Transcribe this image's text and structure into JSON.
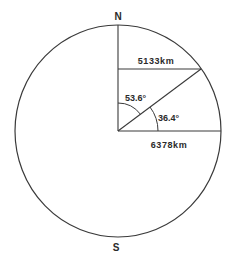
{
  "diagram": {
    "pole_labels": {
      "north": "N",
      "south": "S"
    },
    "distances": {
      "horizontal_chord": "5133km",
      "radius": "6378km"
    },
    "angles": {
      "colatitude": "53.6°",
      "latitude": "36.4°"
    },
    "colors": {
      "line": "#3a3a3a",
      "text": "#2a2a2a",
      "background": "#ffffff"
    }
  }
}
